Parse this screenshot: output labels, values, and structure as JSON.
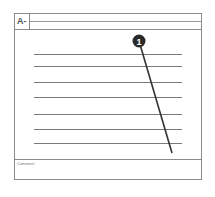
{
  "header": {
    "cell_label": "A-"
  },
  "body": {
    "rule_count": 7
  },
  "comment": {
    "label": "Comment"
  },
  "callout": {
    "number": "1"
  }
}
